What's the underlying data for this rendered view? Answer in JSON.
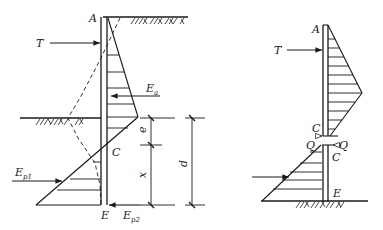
{
  "figure": {
    "left_diagram": {
      "labels": {
        "top": "A",
        "anchor_force": "T",
        "active_force": "E",
        "active_force_sub": "a",
        "zero_point": "C",
        "passive_force_1": "E",
        "passive_force_1_sub": "p1",
        "passive_force_2": "E",
        "passive_force_2_sub": "p2",
        "bottom": "E",
        "dim_e": "e",
        "dim_x": "x",
        "dim_d": "d"
      }
    },
    "right_diagram": {
      "labels": {
        "top": "A",
        "anchor_force": "T",
        "upper_c": "C",
        "lower_c": "C",
        "shear_left": "Q",
        "shear_right": "Q",
        "bottom": "E"
      }
    },
    "colors": {
      "line": "#1a1a1a",
      "background": "#ffffff"
    }
  }
}
